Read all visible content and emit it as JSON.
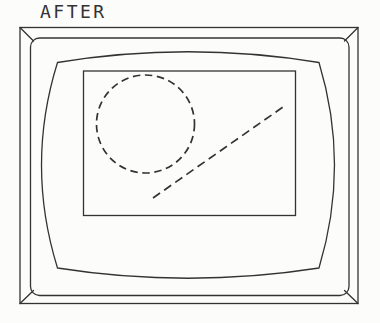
{
  "title": {
    "label": "AFTER"
  },
  "colors": {
    "ink": "#333333",
    "paper": "#fcfcfb"
  },
  "monitor": {
    "outer_case": {
      "x": "20",
      "y": "27.5",
      "width": "338",
      "height": "276"
    },
    "bezel": {
      "x": "30.5",
      "y": "38",
      "width": "318.5",
      "height": "257.5",
      "rx": "9"
    },
    "bevel_top_left": {
      "x1": "20",
      "y1": "27.5",
      "x2": "33.5",
      "y2": "41"
    },
    "bevel_top_right": {
      "x1": "358",
      "y1": "27.5",
      "x2": "344.5",
      "y2": "41"
    },
    "bevel_bottom_left": {
      "x1": "20",
      "y1": "303.5",
      "x2": "33.5",
      "y2": "290.5"
    },
    "bevel_bottom_right": {
      "x1": "358",
      "y1": "303.5",
      "x2": "344.5",
      "y2": "290.5"
    },
    "crt_face": {
      "d": "M57.5 62.5 Q188 41 319 62.5 Q350 165 319 268 Q188 288.5 57.5 268 Q25.5 165 57.5 62.5 Z"
    },
    "display_area": {
      "x": "83.5",
      "y": "71",
      "width": "212",
      "height": "144.5"
    }
  },
  "screen_drawing": {
    "dashed_circle": {
      "cx": "145.5",
      "cy": "124",
      "r": "49",
      "dash": "7.5 4.6"
    },
    "dashed_line": {
      "x1": "153",
      "y1": "198",
      "x2": "283",
      "y2": "107",
      "dash": "8.6 5"
    }
  }
}
